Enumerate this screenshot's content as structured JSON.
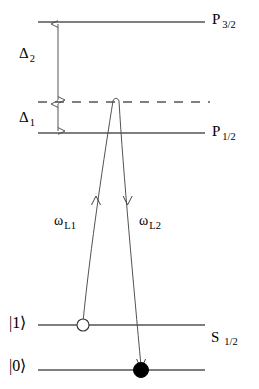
{
  "figure": {
    "kind": "atomic-energy-level-diagram",
    "background_color": "#ffffff",
    "line_color": "#555555",
    "text_color": "#000000",
    "arrow_color": "#444444"
  },
  "levels": [
    {
      "id": "p32",
      "label": "P",
      "subscript": "3/2",
      "style": "solid",
      "y": 22,
      "x1": 38,
      "x2": 205
    },
    {
      "id": "virtual",
      "label": "",
      "subscript": "",
      "style": "dashed",
      "y": 102,
      "x1": 38,
      "x2": 210
    },
    {
      "id": "p12",
      "label": "P",
      "subscript": "1/2",
      "style": "solid",
      "y": 133,
      "x1": 38,
      "x2": 205
    },
    {
      "id": "state1",
      "label": "|1⟩",
      "subscript": "",
      "style": "solid",
      "y": 325,
      "x1": 38,
      "x2": 205
    },
    {
      "id": "state0",
      "label": "|0⟩",
      "subscript": "",
      "style": "solid",
      "y": 370,
      "x1": 38,
      "x2": 205
    }
  ],
  "term_labels": {
    "p32": {
      "symbol": "P",
      "subscript": "3/2"
    },
    "p12": {
      "symbol": "P",
      "subscript": "1/2"
    },
    "s12": {
      "symbol": "S",
      "subscript": "1/2"
    }
  },
  "ket_labels": {
    "upper": "|1⟩",
    "lower": "|0⟩"
  },
  "detunings": [
    {
      "id": "delta2",
      "symbol": "Δ",
      "subscript": "2",
      "from_level": "p32",
      "to_level": "virtual",
      "arrow": "double-headed-vertical",
      "x": 58,
      "y_top": 22,
      "y_bottom": 102
    },
    {
      "id": "delta1",
      "symbol": "Δ",
      "subscript": "1",
      "from_level": "virtual",
      "to_level": "p12",
      "arrow": "double-headed-vertical",
      "x": 58,
      "y_top": 102,
      "y_bottom": 133
    }
  ],
  "laser_fields": [
    {
      "id": "wL1",
      "symbol": "ω",
      "subscript": "L1",
      "direction": "up",
      "from": "state1",
      "to": "virtual",
      "x_start": 83,
      "y_start": 325,
      "x_end": 113,
      "y_end": 100,
      "arrowhead_x": 96,
      "arrowhead_y": 200
    },
    {
      "id": "wL2",
      "symbol": "ω",
      "subscript": "L2",
      "direction": "down",
      "from": "virtual",
      "to": "state0",
      "x_start": 119,
      "y_start": 100,
      "x_end": 141,
      "y_end": 370,
      "arrowhead_x": 128,
      "arrowhead_y": 200
    }
  ],
  "population_markers": [
    {
      "id": "marker-open",
      "type": "open-circle",
      "on_level": "state1",
      "x": 83,
      "y": 325,
      "radius": 6,
      "fill": "#ffffff",
      "stroke": "#333333"
    },
    {
      "id": "marker-filled",
      "type": "filled-circle",
      "on_level": "state0",
      "x": 141,
      "y": 370,
      "radius": 7,
      "fill": "#000000",
      "stroke": "#000000"
    }
  ]
}
